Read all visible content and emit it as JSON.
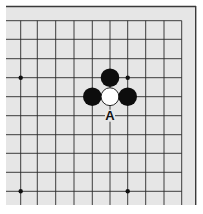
{
  "board": {
    "background": "#e6e6e6",
    "line_color": "#2a2a2a",
    "border_color": "#3a3a3a",
    "area": {
      "x": 6,
      "y": 6,
      "w": 190,
      "h": 199
    },
    "cols_x": [
      20.7,
      37.3,
      55.7,
      74,
      92.3,
      110,
      127.7,
      145.7,
      164,
      181.7
    ],
    "rows_y": [
      20.7,
      39.3,
      58.7,
      77.7,
      96.7,
      115.7,
      134.7,
      153.3,
      172.3,
      191.3
    ],
    "line_extent": {
      "x_min": 6,
      "x_max": 181.7,
      "y_min": 20.7,
      "y_max": 205
    },
    "star_points": [
      {
        "col": 0,
        "row": 3
      },
      {
        "col": 6,
        "row": 3
      },
      {
        "col": 0,
        "row": 9
      },
      {
        "col": 6,
        "row": 9
      }
    ],
    "stones": [
      {
        "col": 5,
        "row": 3,
        "color": "black"
      },
      {
        "col": 4,
        "row": 4,
        "color": "black"
      },
      {
        "col": 5,
        "row": 4,
        "color": "white"
      },
      {
        "col": 6,
        "row": 4,
        "color": "black"
      }
    ],
    "labels": [
      {
        "col": 5,
        "row": 5,
        "text": "A"
      }
    ],
    "stone_radius": 9.3,
    "star_radius": 2.2
  }
}
